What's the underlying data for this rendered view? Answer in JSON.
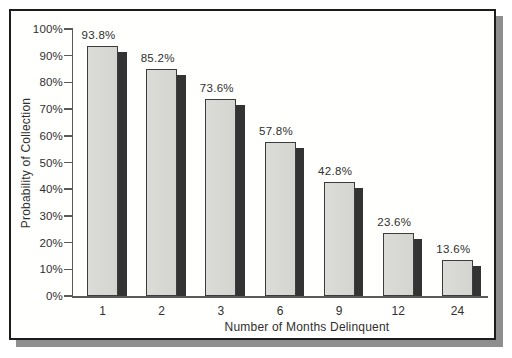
{
  "chart_data": {
    "type": "bar",
    "title": "",
    "xlabel": "Number of Months Delinquent",
    "ylabel": "Probability of Collection",
    "categories": [
      "1",
      "2",
      "3",
      "6",
      "9",
      "12",
      "24"
    ],
    "values": [
      93.8,
      85.2,
      73.6,
      57.8,
      42.8,
      23.6,
      13.6
    ],
    "value_labels": [
      "93.8%",
      "85.2%",
      "73.6%",
      "57.8%",
      "42.8%",
      "23.6%",
      "13.6%"
    ],
    "ylim": [
      0,
      100
    ],
    "ytick_step": 10,
    "ytick_labels": [
      "0%",
      "10%",
      "20%",
      "30%",
      "40%",
      "50%",
      "60%",
      "70%",
      "80%",
      "90%",
      "100%"
    ],
    "grid": false,
    "legend": null,
    "bar_style": "3d-shadowed",
    "colors": {
      "bar_fill": "#d8d8d4",
      "bar_border": "#3c3c3c",
      "bar_shadow": "#333333",
      "axis": "#5a5a5a",
      "text": "#2f2f2f",
      "frame_border": "#1c1c1c",
      "frame_shadow": "#8e8e8e",
      "background": "#fffffd"
    }
  }
}
